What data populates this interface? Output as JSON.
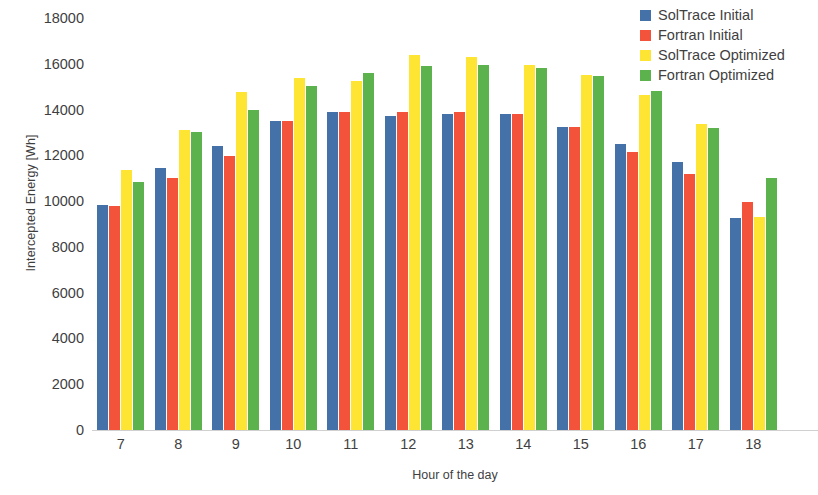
{
  "chart_data": {
    "type": "bar",
    "title": "",
    "subtitle": "",
    "xlabel": "Hour of the day",
    "ylabel": "Intercepted Energy [Wh]",
    "ylim": [
      0,
      18000
    ],
    "ytick_step": 2000,
    "yticks": [
      0,
      2000,
      4000,
      6000,
      8000,
      10000,
      12000,
      14000,
      16000,
      18000
    ],
    "ytick_labels": [
      "0",
      "2000",
      "4000",
      "6000",
      "8000",
      "10000",
      "12000",
      "14000",
      "16000",
      "18000"
    ],
    "grid": false,
    "legend_position": "top-right",
    "categories": [
      "7",
      "8",
      "9",
      "10",
      "11",
      "12",
      "13",
      "14",
      "15",
      "16",
      "17",
      "18"
    ],
    "series": [
      {
        "name": "SolTrace Initial",
        "color": "#4472a8",
        "values": [
          9850,
          11450,
          12400,
          13500,
          13900,
          13700,
          13800,
          13800,
          13250,
          12500,
          11700,
          9250
        ]
      },
      {
        "name": "Fortran Initial",
        "color": "#f2533a",
        "values": [
          9800,
          11000,
          11950,
          13500,
          13900,
          13900,
          13900,
          13800,
          13250,
          12150,
          11200,
          9950
        ]
      },
      {
        "name": "SolTrace Optimized",
        "color": "#ffe533",
        "values": [
          11350,
          13100,
          14750,
          15400,
          15250,
          16400,
          16300,
          15950,
          15500,
          14650,
          13350,
          9300
        ]
      },
      {
        "name": "Fortran Optimized",
        "color": "#5cb24d",
        "values": [
          10850,
          13000,
          14000,
          15050,
          15600,
          15900,
          15950,
          15800,
          15450,
          14800,
          13200,
          11000
        ]
      }
    ]
  },
  "axis": {
    "x_title": "Hour of the day",
    "y_title": "Intercepted Energy [Wh]"
  }
}
